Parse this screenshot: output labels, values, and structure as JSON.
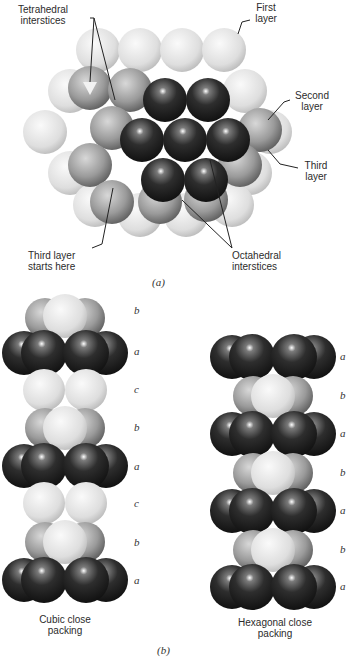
{
  "figure_a": {
    "labels": {
      "tetrahedral": "Tetrahedral\ninterstices",
      "first_layer": "First\nlayer",
      "second_layer": "Second\nlayer",
      "third_layer": "Third\nlayer",
      "third_layer_starts": "Third layer\nstarts here",
      "octahedral": "Octahedral\ninterstices"
    },
    "caption": "(a)"
  },
  "figure_b": {
    "cubic": {
      "title": "Cubic close\npacking",
      "layers": [
        "b",
        "a",
        "c",
        "b",
        "a",
        "c",
        "b",
        "a"
      ]
    },
    "hexagonal": {
      "title": "Hexagonal close\npacking",
      "layers": [
        "a",
        "b",
        "a",
        "b",
        "a",
        "b",
        "a"
      ]
    },
    "caption": "(b)"
  },
  "colors": {
    "light_sphere": "#e4e4e4",
    "mid_sphere": "#9a9a9a",
    "dark_sphere": "#2a2a2a",
    "background": "#ffffff"
  }
}
